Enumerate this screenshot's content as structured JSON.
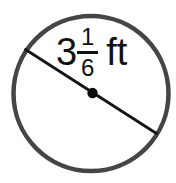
{
  "figure": {
    "type": "circle-with-diameter",
    "label": {
      "whole": "3",
      "numerator": "1",
      "denominator": "6",
      "unit": "ft",
      "value_text": "3 1/6 ft"
    },
    "colors": {
      "background": "#ffffff",
      "circle_stroke": "#454545",
      "diameter_line": "#151515",
      "center_dot": "#0d0d0d",
      "text": "#111111"
    },
    "geometry": {
      "circle_center_x": "91",
      "circle_center_y": "93.5",
      "circle_radius": "77.5",
      "line_x1": "25.5",
      "line_y1": "49.5",
      "line_x2": "156.5",
      "line_y2": "133.5",
      "dot_radius": "5.2"
    }
  }
}
